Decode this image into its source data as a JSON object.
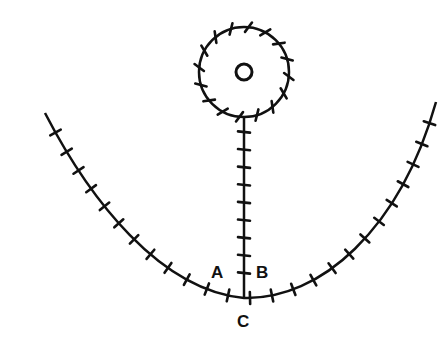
{
  "diagram": {
    "type": "tick-marked line diagram",
    "stroke_color": "#111111",
    "background": "#ffffff",
    "labels": {
      "a": "A",
      "b": "B",
      "c": "C"
    },
    "elements": {
      "outer_circle": {
        "cx": 244,
        "cy": 72,
        "r": 45,
        "tick_count": 16
      },
      "inner_circle": {
        "cx": 244,
        "cy": 72,
        "r": 8
      },
      "stem": {
        "x": 244,
        "y_top": 117,
        "y_bottom": 298,
        "tick_count": 9
      },
      "curve": {
        "start": [
          45,
          113
        ],
        "bottom": [
          244,
          298
        ],
        "end": [
          436,
          102
        ],
        "left_tick_count": 13,
        "right_tick_count": 12
      }
    }
  }
}
